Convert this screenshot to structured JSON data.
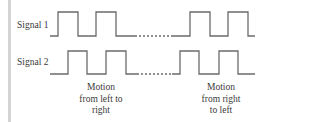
{
  "diagram": {
    "type": "timing-diagram",
    "signals": [
      {
        "label": "Signal 1",
        "pulses_left": 2,
        "pulses_right": 2,
        "gap": "dotted"
      },
      {
        "label": "Signal 2",
        "pulses_left": 2,
        "pulses_right": 2,
        "gap": "dotted"
      }
    ],
    "captions": {
      "left_to_right": [
        "Motion",
        "from left to",
        "right"
      ],
      "right_to_left": [
        "Motion",
        "from right",
        "to left"
      ]
    },
    "colors": {
      "line": "#6b6b6b",
      "text": "#3a3a3a",
      "side_bar": "#d4d4d4"
    }
  }
}
